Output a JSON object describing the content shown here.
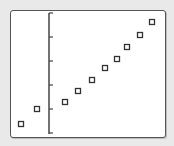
{
  "calculator_screen": {
    "description": "Graphing calculator scatter plot window"
  },
  "chart_data": {
    "type": "scatter",
    "title": "",
    "xlabel": "",
    "ylabel": "",
    "grid": false,
    "legend": null,
    "marker": "hollow-square",
    "axis": {
      "y_axis_visible": true,
      "x_axis_visible": false,
      "y_tick_count": 6
    },
    "pixel_points": [
      [
        21,
        124
      ],
      [
        37,
        109
      ],
      [
        65,
        102
      ],
      [
        78,
        91
      ],
      [
        92,
        80
      ],
      [
        105,
        68
      ],
      [
        117,
        59
      ],
      [
        127,
        47
      ],
      [
        140,
        35
      ],
      [
        152,
        22
      ]
    ],
    "x": [
      -2,
      -1,
      1,
      2,
      3,
      4,
      5,
      6,
      7,
      8
    ],
    "y": [
      0.5,
      1.1,
      1.4,
      1.8,
      2.3,
      2.8,
      3.1,
      3.6,
      4.1,
      4.6
    ],
    "y_ticks": [
      0,
      1,
      2,
      3,
      4,
      5
    ],
    "colors": {
      "marker": "#333333",
      "axis": "#444444",
      "background": "#ffffff"
    }
  }
}
